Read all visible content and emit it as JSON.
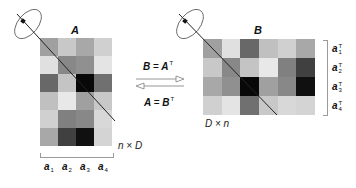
{
  "matrix_a": {
    "title": "A",
    "dims": "n × D",
    "rows": 6,
    "cols": 4,
    "cells": [
      [
        "#a0a0a0",
        "#c8c8c8",
        "#a8a8a8",
        "#d0d0d0"
      ],
      [
        "#e0e0e0",
        "#888888",
        "#909090",
        "#e4e4e4"
      ],
      [
        "#686868",
        "#c4c4c4",
        "#080808",
        "#707070"
      ],
      [
        "#c0c0c0",
        "#e8e8e8",
        "#a0a0a0",
        "#c8c8c8"
      ],
      [
        "#d0d0d0",
        "#808080",
        "#888888",
        "#d8d8d8"
      ],
      [
        "#a8a8a8",
        "#404040",
        "#101010",
        "#d4d4d4"
      ]
    ],
    "column_labels": [
      {
        "base": "a",
        "sub": "1"
      },
      {
        "base": "a",
        "sub": "2"
      },
      {
        "base": "a",
        "sub": "3"
      },
      {
        "base": "a",
        "sub": "4"
      }
    ]
  },
  "matrix_b": {
    "title": "B",
    "dims": "D × n",
    "rows": 4,
    "cols": 6,
    "row_labels": [
      {
        "base": "a",
        "sup": "T",
        "sub": "1"
      },
      {
        "base": "a",
        "sup": "T",
        "sub": "2"
      },
      {
        "base": "a",
        "sup": "T",
        "sub": "3"
      },
      {
        "base": "a",
        "sup": "T",
        "sub": "4"
      }
    ]
  },
  "relations": {
    "top": "B = Aᵀ",
    "top_lhs": "B",
    "top_rhs": "A",
    "bottom_lhs": "A",
    "bottom_rhs": "B",
    "equals": "=",
    "transpose_mark": "T"
  },
  "colors": {
    "line": "#222222",
    "arrow": "#8a8a8a",
    "bracket": "#9a9a9a"
  }
}
